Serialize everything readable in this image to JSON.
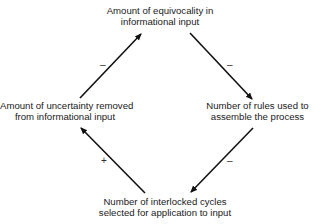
{
  "nodes": {
    "top": {
      "line1": "Amount of equivocality in",
      "line2": "informational input"
    },
    "left": {
      "line1": "Amount of uncertainty removed",
      "line2": "from informational input"
    },
    "right": {
      "line1": "Number of rules used to",
      "line2": "assemble the process"
    },
    "bottom": {
      "line1": "Number of interlocked cycles",
      "line2": "selected for application to input"
    }
  },
  "edges": [
    {
      "from": "left",
      "to": "top",
      "sign": "–"
    },
    {
      "from": "top",
      "to": "right",
      "sign": "–"
    },
    {
      "from": "right",
      "to": "bottom",
      "sign": "–"
    },
    {
      "from": "bottom",
      "to": "left",
      "sign": "+"
    }
  ],
  "colors": {
    "line": "#111111",
    "text": "#1a1a1a"
  }
}
